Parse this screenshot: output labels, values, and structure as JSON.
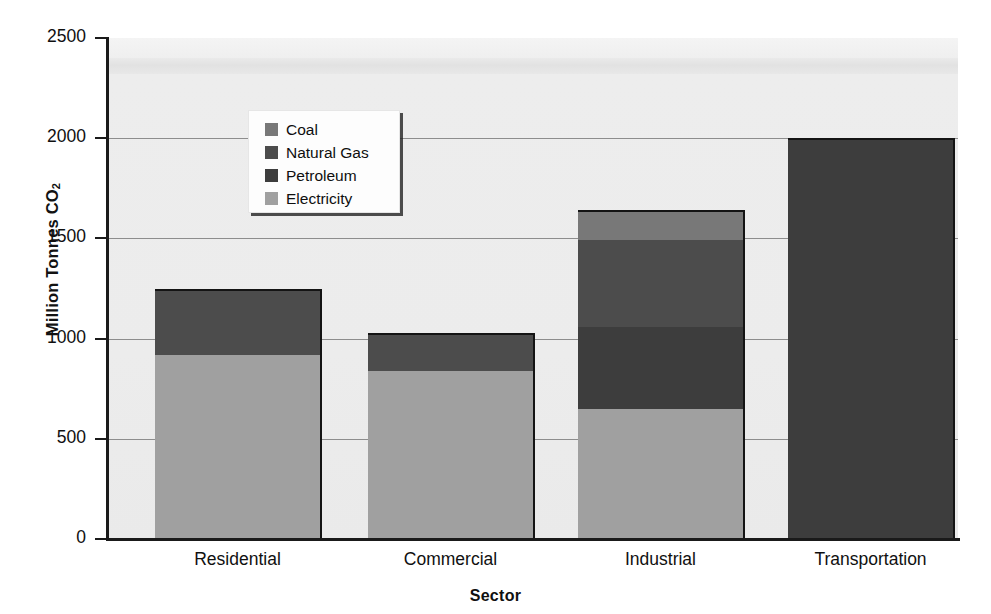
{
  "chart_data": {
    "type": "bar",
    "subtype": "stacked-bar",
    "title": "",
    "xlabel": "Sector",
    "ylabel": "Million Tonnes CO2",
    "ylabel_display": "Million Tonnes CO",
    "ylabel_subscript": "2",
    "categories": [
      "Residential",
      "Commercial",
      "Industrial",
      "Transportation"
    ],
    "series": [
      {
        "name": "Electricity",
        "values": [
          920,
          840,
          650,
          0
        ],
        "color": "#a0a0a0"
      },
      {
        "name": "Petroleum",
        "values": [
          0,
          0,
          410,
          2000
        ],
        "color": "#3d3d3d"
      },
      {
        "name": "Natural Gas",
        "values": [
          330,
          190,
          430,
          0
        ],
        "color": "#4c4c4c"
      },
      {
        "name": "Coal",
        "values": [
          0,
          0,
          150,
          0
        ],
        "color": "#787878"
      }
    ],
    "stack_order_bottom_to_top": [
      "Electricity",
      "Petroleum",
      "Natural Gas",
      "Coal"
    ],
    "totals": [
      1250,
      1030,
      1640,
      2000
    ],
    "ylim": [
      0,
      2500
    ],
    "yticks": [
      0,
      500,
      1000,
      1500,
      2000,
      2500
    ],
    "ytick_labels": [
      "0",
      "500",
      "1000",
      "1500",
      "2000",
      "2500"
    ],
    "grid": true,
    "grid_axis": "y",
    "legend_position": "upper-left-inside",
    "plot_background": "#ececec"
  },
  "axes": {
    "y_title_text": "Million Tonnes CO",
    "y_title_sub": "2",
    "x_title_text": "Sector",
    "ticks": [
      {
        "label": "2500",
        "value": 2500
      },
      {
        "label": "2000",
        "value": 2000
      },
      {
        "label": "1500",
        "value": 1500
      },
      {
        "label": "1000",
        "value": 1000
      },
      {
        "label": "500",
        "value": 500
      },
      {
        "label": "0",
        "value": 0
      }
    ]
  },
  "legend": {
    "items": [
      {
        "label": "Coal",
        "color": "#787878"
      },
      {
        "label": "Natural Gas",
        "color": "#4c4c4c"
      },
      {
        "label": "Petroleum",
        "color": "#3d3d3d"
      },
      {
        "label": "Electricity",
        "color": "#a0a0a0"
      }
    ]
  },
  "bars": [
    {
      "category": "Residential",
      "segments": [
        {
          "series": "Natural Gas",
          "from": 920,
          "to": 1250,
          "color": "#4c4c4c"
        },
        {
          "series": "Electricity",
          "from": 0,
          "to": 920,
          "color": "#a0a0a0"
        }
      ],
      "total": 1250
    },
    {
      "category": "Commercial",
      "segments": [
        {
          "series": "Natural Gas",
          "from": 840,
          "to": 1030,
          "color": "#4c4c4c"
        },
        {
          "series": "Electricity",
          "from": 0,
          "to": 840,
          "color": "#a0a0a0"
        }
      ],
      "total": 1030
    },
    {
      "category": "Industrial",
      "segments": [
        {
          "series": "Coal",
          "from": 1490,
          "to": 1640,
          "color": "#787878"
        },
        {
          "series": "Natural Gas",
          "from": 1060,
          "to": 1490,
          "color": "#4c4c4c"
        },
        {
          "series": "Petroleum",
          "from": 650,
          "to": 1060,
          "color": "#3d3d3d"
        },
        {
          "series": "Electricity",
          "from": 0,
          "to": 650,
          "color": "#a0a0a0"
        }
      ],
      "total": 1640
    },
    {
      "category": "Transportation",
      "segments": [
        {
          "series": "Petroleum",
          "from": 0,
          "to": 2000,
          "color": "#3d3d3d"
        }
      ],
      "total": 2000
    }
  ],
  "geometry": {
    "plot_left": 109,
    "plot_right": 958,
    "plot_top": 38,
    "plot_bottom": 539,
    "bar_x": [
      155,
      368,
      578,
      788
    ],
    "bar_width": 165
  }
}
